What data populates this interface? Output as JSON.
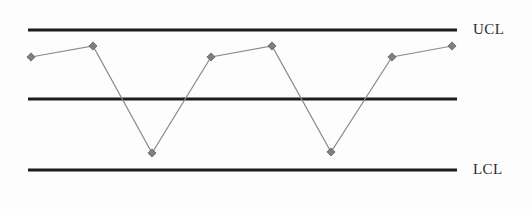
{
  "chart_data": {
    "type": "line",
    "title": "",
    "subtitle": "",
    "xlabel": "",
    "ylabel": "",
    "grid": false,
    "legend_position": "right",
    "axis_ranges": {
      "xlim": [
        0,
        9
      ],
      "ylim": [
        0,
        10
      ]
    },
    "categories": [
      "1",
      "2",
      "3",
      "4",
      "5",
      "6",
      "7",
      "8"
    ],
    "series": [
      {
        "name": "Measurement",
        "marker": "diamond",
        "color": "#7a7a7a",
        "values": [
          6.9,
          7.7,
          1.2,
          6.9,
          7.7,
          1.3,
          6.9,
          7.7
        ]
      }
    ],
    "control_limits": [
      {
        "id": "ucl",
        "label": "UCL",
        "value": 10,
        "color": "#1d1d1d"
      },
      {
        "id": "center",
        "label": "",
        "value": 5,
        "color": "#1d1d1d"
      },
      {
        "id": "lcl",
        "label": "LCL",
        "value": 0,
        "color": "#1d1d1d"
      }
    ],
    "points_px": [
      {
        "x": 31,
        "y": 57
      },
      {
        "x": 93,
        "y": 46
      },
      {
        "x": 152,
        "y": 153
      },
      {
        "x": 211,
        "y": 57
      },
      {
        "x": 272,
        "y": 46
      },
      {
        "x": 331,
        "y": 152
      },
      {
        "x": 392,
        "y": 57
      },
      {
        "x": 452,
        "y": 46
      }
    ],
    "limit_lines_px": [
      {
        "id": "ucl",
        "y": 30,
        "x1": 28,
        "x2": 457
      },
      {
        "id": "center",
        "y": 99,
        "x1": 28,
        "x2": 457
      },
      {
        "id": "lcl",
        "y": 170,
        "x1": 28,
        "x2": 457
      }
    ],
    "annotations": [
      {
        "id": "ucl-label",
        "text": "UCL",
        "x": 473,
        "y": 30
      },
      {
        "id": "lcl-label",
        "text": "LCL",
        "x": 473,
        "y": 170
      }
    ]
  },
  "labels": {
    "ucl": "UCL",
    "lcl": "LCL"
  },
  "colors": {
    "limit_line": "#1d1d1d",
    "series_line": "#8a8a8a",
    "marker": "#7f7f7f",
    "marker_stroke": "#5f5f5f",
    "background": "#fdfdfd",
    "label_text": "#2b2b2b"
  }
}
